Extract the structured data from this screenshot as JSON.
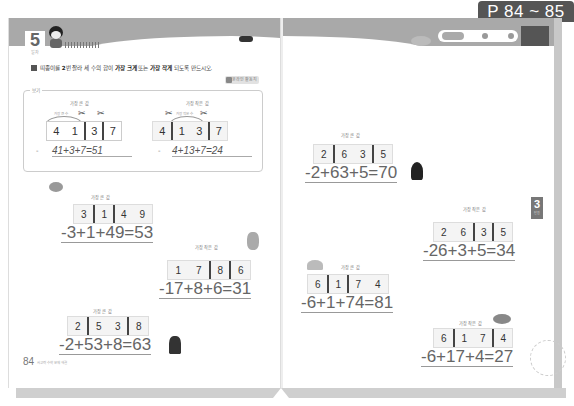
{
  "page_badge": "P 84 ~ 85",
  "left_page": {
    "unit_number": "5",
    "unit_sub": "일차",
    "instruction": {
      "pre": "띠종이를 ",
      "n": "2",
      "mid": "번 잘라 세 수의 합이 ",
      "big": "가장 크게",
      "or": " 또는 ",
      "small": "가장 작게",
      "post": " 되도록 만드시오."
    },
    "online_button": "온라인 활동지",
    "example": {
      "label": "보기",
      "largest": {
        "title": "가장 큰 값",
        "arc_hint": "가장 큰 수",
        "digits": [
          "4",
          "1",
          "3",
          "7"
        ],
        "equation": "41+3+7=51"
      },
      "smallest": {
        "title": "가장 작은 값",
        "arc_hint": "가장 작은 수",
        "digits": [
          "4",
          "1",
          "3",
          "7"
        ],
        "equation": "4+13+7=24"
      }
    },
    "problems": [
      {
        "title": "가장 큰 값",
        "digits": [
          "3",
          "1",
          "4",
          "9"
        ],
        "answer": "-3+1+49=53"
      },
      {
        "title": "가장 작은 값",
        "digits": [
          "1",
          "7",
          "8",
          "6"
        ],
        "answer": "-17+8+6=31"
      },
      {
        "title": "가장 큰 값",
        "digits": [
          "2",
          "5",
          "3",
          "8"
        ],
        "answer": "-2+53+8=63"
      }
    ],
    "page_number": "84",
    "footer_text": "사고력 수학 문제 해결"
  },
  "right_page": {
    "problems": [
      {
        "title": "가장 큰 값",
        "digits": [
          "2",
          "6",
          "3",
          "5"
        ],
        "answer": "-2+63+5=70"
      },
      {
        "title": "가장 작은 값",
        "digits": [
          "2",
          "6",
          "3",
          "5"
        ],
        "answer": "-26+3+5=34"
      },
      {
        "title": "가장 큰 값",
        "digits": [
          "6",
          "1",
          "7",
          "4"
        ],
        "answer": "-6+1+74=81"
      },
      {
        "title": "가장 작은 값",
        "digits": [
          "6",
          "1",
          "7",
          "4"
        ],
        "answer": "-6+17+4=27"
      }
    ],
    "chapter_tab": {
      "number": "3",
      "label": "단원"
    }
  }
}
